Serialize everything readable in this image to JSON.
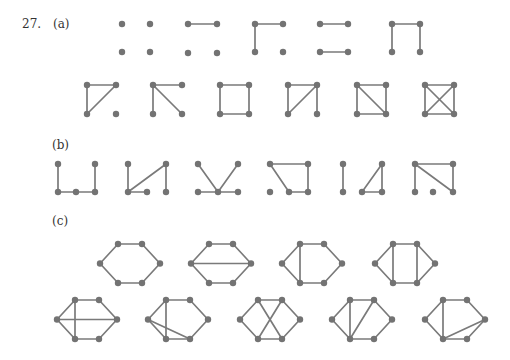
{
  "problem_number": "27.",
  "parts": [
    {
      "label": "(a)",
      "description": "All 11 non-isomorphic simple graphs on 4 vertices",
      "graphs": [
        {
          "name": "empty",
          "vertices": 4,
          "edges": []
        },
        {
          "name": "one-edge",
          "vertices": 4,
          "edges": [
            [
              "tl",
              "tr"
            ]
          ]
        },
        {
          "name": "path-2",
          "vertices": 4,
          "edges": [
            [
              "tl",
              "tr"
            ],
            [
              "tl",
              "bl"
            ]
          ]
        },
        {
          "name": "two-disjoint-edges",
          "vertices": 4,
          "edges": [
            [
              "tl",
              "tr"
            ],
            [
              "bl",
              "br"
            ]
          ]
        },
        {
          "name": "path-3",
          "vertices": 4,
          "edges": [
            [
              "tl",
              "tr"
            ],
            [
              "tl",
              "bl"
            ],
            [
              "tr",
              "br"
            ]
          ]
        },
        {
          "name": "triangle-plus-isolated",
          "vertices": 4,
          "edges": [
            [
              "tl",
              "tr"
            ],
            [
              "tl",
              "bl"
            ],
            [
              "tr",
              "bl"
            ]
          ]
        },
        {
          "name": "star",
          "vertices": 4,
          "edges": [
            [
              "tl",
              "tr"
            ],
            [
              "tl",
              "bl"
            ],
            [
              "tl",
              "br"
            ]
          ]
        },
        {
          "name": "cycle-4",
          "vertices": 4,
          "edges": [
            [
              "tl",
              "tr"
            ],
            [
              "tr",
              "br"
            ],
            [
              "br",
              "bl"
            ],
            [
              "bl",
              "tl"
            ]
          ]
        },
        {
          "name": "paw",
          "vertices": 4,
          "edges": [
            [
              "tl",
              "tr"
            ],
            [
              "tl",
              "bl"
            ],
            [
              "tr",
              "bl"
            ],
            [
              "tr",
              "br"
            ]
          ]
        },
        {
          "name": "diamond",
          "vertices": 4,
          "edges": [
            [
              "tl",
              "tr"
            ],
            [
              "tr",
              "br"
            ],
            [
              "br",
              "bl"
            ],
            [
              "bl",
              "tl"
            ],
            [
              "tl",
              "br"
            ]
          ]
        },
        {
          "name": "complete-k4",
          "vertices": 4,
          "edges": [
            [
              "tl",
              "tr"
            ],
            [
              "tr",
              "br"
            ],
            [
              "br",
              "bl"
            ],
            [
              "bl",
              "tl"
            ],
            [
              "tl",
              "br"
            ],
            [
              "tr",
              "bl"
            ]
          ]
        }
      ]
    },
    {
      "label": "(b)",
      "description": "Graphs on 5 vertices",
      "count": 6
    },
    {
      "label": "(c)",
      "description": "Graphs on 6 vertices drawn on a hexagon",
      "count": 9
    }
  ]
}
